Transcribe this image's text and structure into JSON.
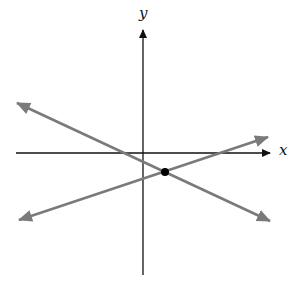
{
  "diagram": {
    "axes": {
      "x_label": "x",
      "y_label": "y"
    },
    "lines": [
      {
        "name": "line-decreasing",
        "x1": 17,
        "y1": 103,
        "x2": 270,
        "y2": 221,
        "color": "#7a7a7a"
      },
      {
        "name": "line-increasing",
        "x1": 19,
        "y1": 220,
        "x2": 268,
        "y2": 137,
        "color": "#7a7a7a"
      }
    ],
    "intersection_point": {
      "x": 165,
      "y": 172,
      "color": "#000000"
    },
    "axis_color": "#111111"
  }
}
